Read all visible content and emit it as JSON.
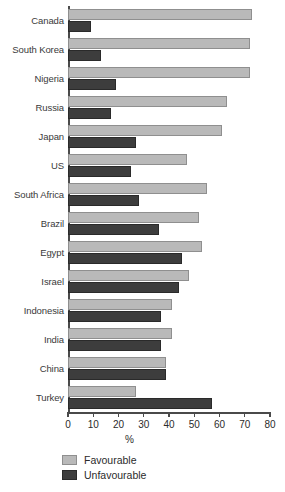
{
  "chart_data": {
    "type": "bar",
    "orientation": "horizontal",
    "title": "",
    "xlabel": "%",
    "ylabel": "",
    "xlim": [
      0,
      80
    ],
    "xticks": [
      0,
      10,
      20,
      30,
      40,
      50,
      60,
      70,
      80
    ],
    "grid": false,
    "legend_position": "bottom-left",
    "categories": [
      "Canada",
      "South Korea",
      "Nigeria",
      "Russia",
      "Japan",
      "US",
      "South Africa",
      "Brazil",
      "Egypt",
      "Israel",
      "Indonesia",
      "India",
      "China",
      "Turkey"
    ],
    "series": [
      {
        "name": "Favourable",
        "color": "#b9b9b9",
        "values": [
          73,
          72,
          72,
          63,
          61,
          47,
          55,
          52,
          53,
          48,
          41,
          41,
          39,
          27
        ]
      },
      {
        "name": "Unfavourable",
        "color": "#3d3d3d",
        "values": [
          9,
          13,
          19,
          17,
          27,
          25,
          28,
          36,
          45,
          44,
          37,
          37,
          39,
          57
        ]
      }
    ]
  },
  "axis": {
    "x_title": "%",
    "tick_labels": [
      "0",
      "10",
      "20",
      "30",
      "40",
      "50",
      "60",
      "70",
      "80"
    ]
  },
  "legend": {
    "items": [
      {
        "label": "Favourable"
      },
      {
        "label": "Unfavourable"
      }
    ]
  }
}
